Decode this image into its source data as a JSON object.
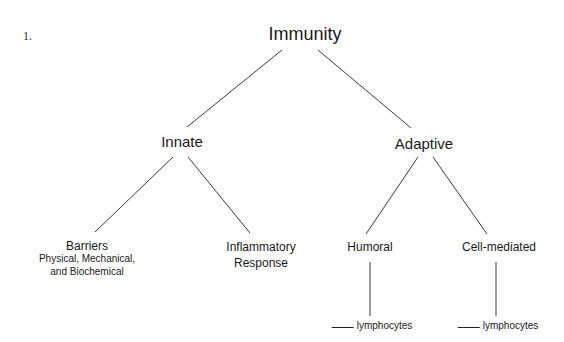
{
  "question_number": "1.",
  "diagram": {
    "type": "tree",
    "root": {
      "label": "Immunity",
      "children": [
        {
          "label": "Innate",
          "children": [
            {
              "label": "Barriers",
              "sublabel_line1": "Physical, Mechanical,",
              "sublabel_line2": "and Biochemical"
            },
            {
              "label_line1": "Inflammatory",
              "label_line2": "Response"
            }
          ]
        },
        {
          "label": "Adaptive",
          "children": [
            {
              "label": "Humoral",
              "child": {
                "blank": "___",
                "label": "lymphocytes"
              }
            },
            {
              "label": "Cell-mediated",
              "child": {
                "blank": "___",
                "label": "lymphocytes"
              }
            }
          ]
        }
      ]
    },
    "line_color": "#3a3a3a"
  }
}
